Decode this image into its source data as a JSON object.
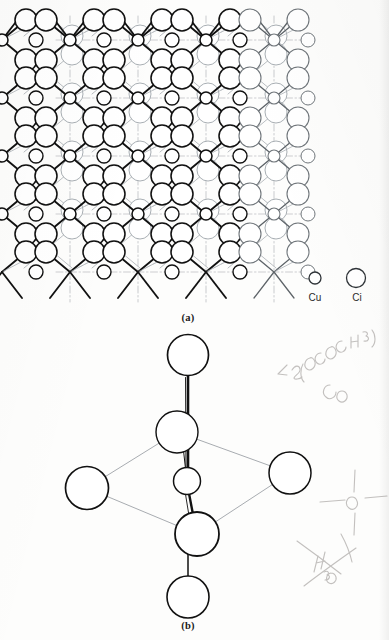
{
  "figure": {
    "panels": [
      {
        "id": "a",
        "caption": "(a)",
        "description": "CuCl2 crystal lattice extended network"
      },
      {
        "id": "b",
        "caption": "(b)",
        "description": "Distorted octahedral CuCl6 coordination unit"
      }
    ]
  },
  "legend": {
    "items": [
      {
        "key": "cu",
        "label": "Cu",
        "radius": 6,
        "cx": 315,
        "cy": 278
      },
      {
        "key": "cl",
        "label": "Ci",
        "radius": 9.5,
        "cx": 356,
        "cy": 278
      }
    ]
  },
  "colors": {
    "atom_stroke_front": "#111111",
    "atom_stroke_back": "#9aa0a6",
    "bond_front": "#111111",
    "bond_back": "#a8adb3",
    "cell_line": "#8d9298",
    "paper": "#fdfdfc",
    "caption_text": "#1a1a1a",
    "pencil": "#b9b6b4"
  },
  "lattice": {
    "origin_x": 14,
    "origin_y": 40,
    "col_spacing": 68,
    "row_spacing": 58,
    "cols": 6,
    "rows": 5,
    "cu_radius": 6.0,
    "cl_radius": 11.0,
    "cl_small_radius": 7.0,
    "depth_dx": 46,
    "depth_dy": -24,
    "fade_start_col": 3
  },
  "octahedron": {
    "center": {
      "cx": 187,
      "cy": 481,
      "r": 13.5,
      "atom": "Cu"
    },
    "axial": [
      {
        "name": "axial-top",
        "cx": 188,
        "cy": 355,
        "r": 20.5,
        "atom": "Cl"
      },
      {
        "name": "axial-bottom",
        "cx": 188,
        "cy": 597,
        "r": 21.0,
        "atom": "Cl"
      }
    ],
    "equatorial": [
      {
        "name": "eq-back",
        "cx": 177,
        "cy": 432,
        "r": 21.0,
        "atom": "Cl"
      },
      {
        "name": "eq-left",
        "cx": 87,
        "cy": 488,
        "r": 21.5,
        "atom": "Cl"
      },
      {
        "name": "eq-right",
        "cx": 290,
        "cy": 473,
        "r": 21.0,
        "atom": "Cl"
      },
      {
        "name": "eq-front",
        "cx": 197,
        "cy": 534,
        "r": 22.0,
        "atom": "Cl"
      }
    ]
  },
  "annotations": {
    "handwritten": [
      {
        "name": "formula-note",
        "text": "2(OCOCH3)",
        "x": 300,
        "y": 362
      },
      {
        "name": "co-note",
        "text": "Co",
        "x": 330,
        "y": 392
      },
      {
        "name": "bond-sketch-note",
        "text": "O",
        "x": 345,
        "y": 500
      },
      {
        "name": "water-note",
        "text": "H2O",
        "x": 325,
        "y": 570
      }
    ]
  }
}
